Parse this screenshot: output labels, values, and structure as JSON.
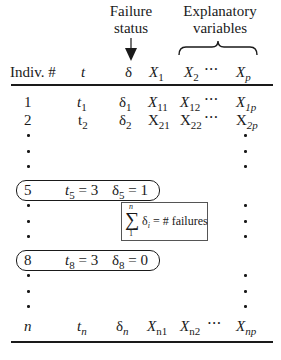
{
  "header": {
    "failure_status_line1": "Failure",
    "failure_status_line2": "status",
    "explanatory_line1": "Explanatory",
    "explanatory_line2": "variables",
    "columns": {
      "indiv": "Indiv. #",
      "t": "t",
      "delta": "δ",
      "x1": "X",
      "x1_sub": "1",
      "x2": "X",
      "x2_sub": "2",
      "ellipsis": "• • •",
      "xp": "X",
      "xp_sub": "p"
    }
  },
  "rows": [
    {
      "indiv": "1",
      "t": "t",
      "t_sub": "1",
      "delta": "δ",
      "delta_sub": "1",
      "x1": "X",
      "x1_sub": "11",
      "x2": "X",
      "x2_sub": "12",
      "ellipsis": "• • •",
      "xp": "X",
      "xp_sub": "1p"
    },
    {
      "indiv": "2",
      "t": "t",
      "t_sub": "2",
      "delta": "δ",
      "delta_sub": "2",
      "x1": "X",
      "x1_sub": "21",
      "x2": "X",
      "x2_sub": "22",
      "ellipsis": "• • •",
      "xp": "X",
      "xp_sub": "2p"
    },
    {
      "indiv": "n",
      "t": "t",
      "t_sub": "n",
      "delta": "δ",
      "delta_sub": "n",
      "x1": "X",
      "x1_sub": "n1",
      "x2": "X",
      "x2_sub": "n2",
      "ellipsis": "• • •",
      "xp": "X",
      "xp_sub": "np"
    }
  ],
  "highlight_rows": [
    {
      "indiv": "5",
      "t": "t",
      "t_sub": "5",
      "t_val": " = 3",
      "delta": "δ",
      "delta_sub": "5",
      "delta_val": " = 1"
    },
    {
      "indiv": "8",
      "t": "t",
      "t_sub": "8",
      "t_val": " = 3",
      "delta": "δ",
      "delta_sub": "8",
      "delta_val": " = 0"
    }
  ],
  "annotation": {
    "sum_symbol": "∑",
    "upper": "n",
    "lower": "1",
    "delta": "δ",
    "delta_sub": "i",
    "text": " = # failures"
  }
}
